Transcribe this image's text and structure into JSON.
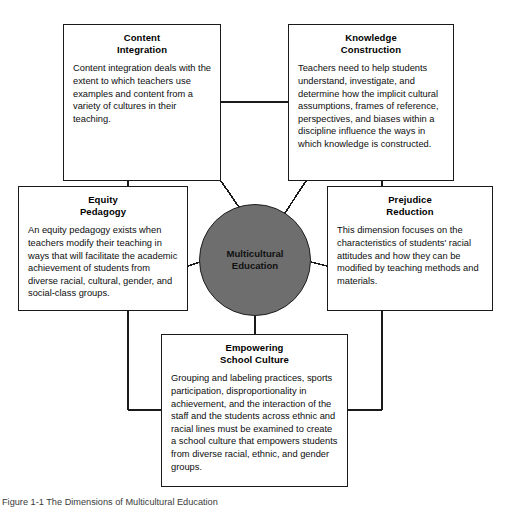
{
  "diagram": {
    "center": {
      "label_line1": "Multicultural",
      "label_line2": "Education",
      "fill_color": "#6e6e6e",
      "stroke_color": "#1f1f1f"
    },
    "boxes": [
      {
        "id": "content-integration",
        "title_line1": "Content",
        "title_line2": "Integration",
        "body": "Content integration deals with the extent to which teachers use examples and content from a variety of cultures in their teaching."
      },
      {
        "id": "knowledge-construction",
        "title_line1": "Knowledge",
        "title_line2": "Construction",
        "body": "Teachers need to help students understand, investigate, and determine how the implicit cultural assumptions, frames of reference, perspectives, and biases within a discipline influence the ways in which knowledge is constructed."
      },
      {
        "id": "equity-pedagogy",
        "title_line1": "Equity",
        "title_line2": "Pedagogy",
        "body": "An equity pedagogy exists when teachers modify their teaching in ways that will facilitate the academic achievement of students from diverse racial, cultural, gender, and social-class groups."
      },
      {
        "id": "prejudice-reduction",
        "title_line1": "Prejudice",
        "title_line2": "Reduction",
        "body": "This dimension focuses on the characteristics of students' racial attitudes and how they can be modified by teaching methods and materials."
      },
      {
        "id": "empowering-school-culture",
        "title_line1": "Empowering",
        "title_line2": "School Culture",
        "body": "Grouping and labeling practices, sports participation, disproportionality in achievement, and the interaction of the staff and the students across ethnic and racial lines must be examined to create a school culture that empowers students from diverse racial, ethnic, and gender groups."
      }
    ],
    "caption": "Figure 1-1   The Dimensions of Multicultural Education",
    "line_color": "#1a1a1a"
  }
}
